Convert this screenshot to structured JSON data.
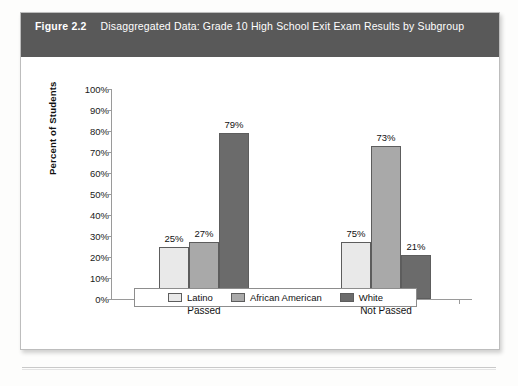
{
  "figure": {
    "number_label": "Figure 2.2",
    "title": "Disaggregated Data: Grade 10 High School Exit Exam Results by Subgroup",
    "header_bg": "#595959",
    "header_text_color": "#ffffff"
  },
  "chart_data": {
    "type": "bar",
    "title": "Disaggregated Data: Grade 10 High School Exit Exam Results by Subgroup",
    "xlabel": "",
    "ylabel": "Percent of Students",
    "ylim": [
      0,
      100
    ],
    "ytick_labels": [
      "100%",
      "90%",
      "80%",
      "70%",
      "60%",
      "50%",
      "40%",
      "30%",
      "20%",
      "10%",
      "0%"
    ],
    "ytick_values": [
      100,
      90,
      80,
      70,
      60,
      50,
      40,
      30,
      20,
      10,
      0
    ],
    "grid": false,
    "legend_position": "bottom",
    "categories": [
      "Passed",
      "Not Passed"
    ],
    "series": [
      {
        "name": "Latino",
        "values": [
          25,
          27
        ],
        "color": "#e9e9e9"
      },
      {
        "name": "African American",
        "values": [
          27,
          73
        ],
        "color": "#a9a9a9"
      },
      {
        "name": "White",
        "values": [
          79,
          21
        ],
        "color": "#6b6b6b"
      }
    ],
    "data_labels": {
      "Passed": [
        "25%",
        "27%",
        "79%"
      ],
      "Not Passed": [
        "75%",
        "73%",
        "21%"
      ]
    }
  },
  "legend": {
    "items": [
      {
        "label": "Latino",
        "color": "#e9e9e9"
      },
      {
        "label": "African American",
        "color": "#a9a9a9"
      },
      {
        "label": "White",
        "color": "#6b6b6b"
      }
    ]
  }
}
